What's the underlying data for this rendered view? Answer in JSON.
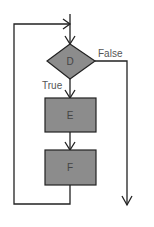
{
  "diagram": {
    "type": "flowchart-loop",
    "colors": {
      "background": "#ffffff",
      "stroke": "#222222",
      "node_fill": "#8c8c8c",
      "label_text": "#555555"
    },
    "nodes": [
      {
        "id": "D",
        "shape": "diamond",
        "label": "D"
      },
      {
        "id": "E",
        "shape": "rectangle",
        "label": "E"
      },
      {
        "id": "F",
        "shape": "rectangle",
        "label": "F"
      }
    ],
    "edges": [
      {
        "from": "entry",
        "to": "D",
        "label": ""
      },
      {
        "from": "D",
        "to": "E",
        "label": "True"
      },
      {
        "from": "E",
        "to": "F",
        "label": ""
      },
      {
        "from": "F",
        "to": "D",
        "label": "",
        "note": "loop back"
      },
      {
        "from": "D",
        "to": "exit",
        "label": "False"
      }
    ],
    "labels": {
      "true": "True",
      "false": "False"
    }
  }
}
